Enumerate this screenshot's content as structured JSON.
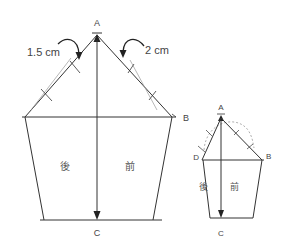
{
  "large_diagram": {
    "labels": {
      "apex": "A",
      "right_corner": "B",
      "bottom": "C",
      "back": "後",
      "front": "前"
    },
    "annotations": {
      "left_offset": "1.5 cm",
      "right_offset": "2 cm"
    }
  },
  "small_diagram": {
    "labels": {
      "apex": "A",
      "left_corner": "D",
      "right_corner": "B",
      "bottom": "C",
      "back": "後",
      "front": "前"
    }
  },
  "colors": {
    "line": "#333333",
    "guide": "#888888",
    "label": "#444444"
  }
}
